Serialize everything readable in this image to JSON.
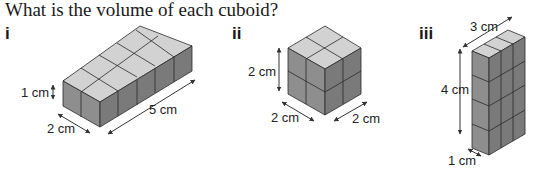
{
  "question": "What is the volume of each cuboid?",
  "figures": [
    {
      "label": "i",
      "dimensions": {
        "height": "1 cm",
        "width": "2 cm",
        "length": "5 cm"
      }
    },
    {
      "label": "ii",
      "dimensions": {
        "height": "2 cm",
        "width": "2 cm",
        "length": "2 cm"
      }
    },
    {
      "label": "iii",
      "dimensions": {
        "width": "3 cm",
        "height": "4 cm",
        "depth": "1 cm"
      }
    }
  ],
  "colors": {
    "top": "#d2d2d2",
    "front": "#9a9a9a",
    "side": "#7c7c7c",
    "edge": "#2a2a2a"
  }
}
